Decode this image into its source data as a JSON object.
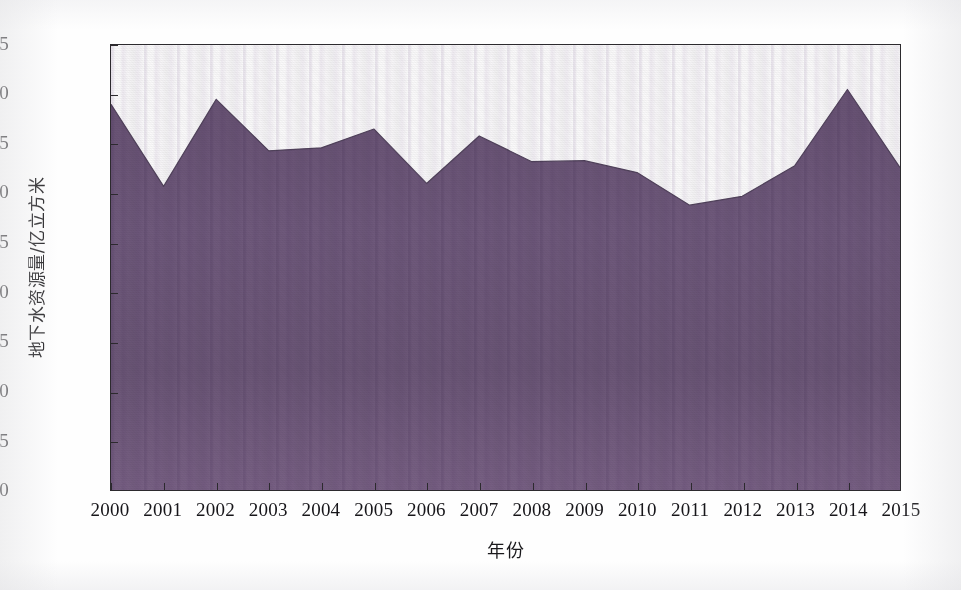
{
  "chart_data": {
    "type": "area",
    "title": "",
    "xlabel": "年份",
    "ylabel": "地下水资源量/亿立方米",
    "categories": [
      "2000",
      "2001",
      "2002",
      "2003",
      "2004",
      "2005",
      "2006",
      "2007",
      "2008",
      "2009",
      "2010",
      "2011",
      "2012",
      "2013",
      "2014",
      "2015"
    ],
    "x": [
      2000,
      2001,
      2002,
      2003,
      2004,
      2005,
      2006,
      2007,
      2008,
      2009,
      2010,
      2011,
      2012,
      2013,
      2014,
      2015
    ],
    "values": [
      39.0,
      30.7,
      39.5,
      34.3,
      34.6,
      36.5,
      31.0,
      35.8,
      33.2,
      33.3,
      32.1,
      28.8,
      29.7,
      32.8,
      40.5,
      32.6
    ],
    "series": [
      {
        "name": "地下水资源量",
        "values": [
          39.0,
          30.7,
          39.5,
          34.3,
          34.6,
          36.5,
          31.0,
          35.8,
          33.2,
          33.3,
          32.1,
          28.8,
          29.7,
          32.8,
          40.5,
          32.6
        ]
      }
    ],
    "ylim": [
      0,
      45
    ],
    "xlim": [
      2000,
      2015
    ],
    "yticks": [
      0,
      5,
      10,
      15,
      20,
      25,
      30,
      35,
      40,
      45
    ],
    "ytick_labels": [
      "0",
      "5",
      "10",
      "15",
      "20",
      "25",
      "30",
      "35",
      "40",
      "45"
    ],
    "xticks": [
      2000,
      2001,
      2002,
      2003,
      2004,
      2005,
      2006,
      2007,
      2008,
      2009,
      2010,
      2011,
      2012,
      2013,
      2014,
      2015
    ],
    "xtick_labels": [
      "2000",
      "2001",
      "2002",
      "2003",
      "2004",
      "2005",
      "2006",
      "2007",
      "2008",
      "2009",
      "2010",
      "2011",
      "2012",
      "2013",
      "2014",
      "2015"
    ],
    "grid": false,
    "legend": false,
    "legend_position": "none",
    "fill_color": "#6f5a7c",
    "line_color": "#5d4b68",
    "axis_color": "#2c2a2e",
    "background_color": "#ffffff"
  },
  "axes": {
    "y_title": "地下水资源量/亿立方米",
    "x_title": "年份"
  }
}
